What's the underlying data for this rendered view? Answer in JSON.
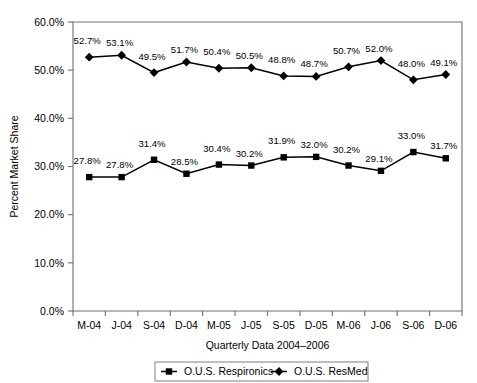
{
  "chart_data": {
    "type": "line",
    "title": "",
    "xlabel": "Quarterly Data 2004–2006",
    "ylabel": "Percent Market Share",
    "categories": [
      "M-04",
      "J-04",
      "S-04",
      "D-04",
      "M-05",
      "J-05",
      "S-05",
      "D-05",
      "M-06",
      "J-06",
      "S-06",
      "D-06"
    ],
    "ylim": [
      0,
      60
    ],
    "ytick_labels": [
      "0.0%",
      "10.0%",
      "20.0%",
      "30.0%",
      "40.0%",
      "50.0%",
      "60.0%"
    ],
    "ytick_values": [
      0,
      10,
      20,
      30,
      40,
      50,
      60
    ],
    "grid": false,
    "legend_position": "bottom",
    "series": [
      {
        "name": "O.U.S. Respironics",
        "marker": "square",
        "color": "#000000",
        "values": [
          27.8,
          27.8,
          31.4,
          28.5,
          30.4,
          30.2,
          31.9,
          32.0,
          30.2,
          29.1,
          33.0,
          31.7
        ],
        "labels": [
          "27.8%",
          "27.8%",
          "31.4%",
          "28.5%",
          "30.4%",
          "30.2%",
          "31.9%",
          "32.0%",
          "30.2%",
          "29.1%",
          "33.0%",
          "31.7%"
        ]
      },
      {
        "name": "O.U.S. ResMed",
        "marker": "diamond",
        "color": "#000000",
        "values": [
          52.7,
          53.1,
          49.5,
          51.7,
          50.4,
          50.5,
          48.8,
          48.7,
          50.7,
          52.0,
          48.0,
          49.1
        ],
        "labels": [
          "52.7%",
          "53.1%",
          "49.5%",
          "51.7%",
          "50.4%",
          "50.5%",
          "48.8%",
          "48.7%",
          "50.7%",
          "52.0%",
          "48.0%",
          "49.1%"
        ]
      }
    ]
  },
  "legend": {
    "entries": [
      {
        "label": "O.U.S. Respironics",
        "marker": "square"
      },
      {
        "label": "O.U.S. ResMed",
        "marker": "diamond"
      }
    ]
  }
}
